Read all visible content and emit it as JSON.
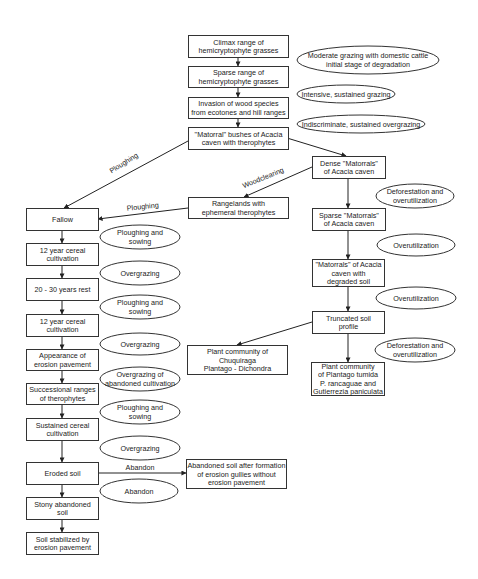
{
  "diagram": {
    "nodes": [
      {
        "id": "n1",
        "type": "box",
        "x": 188,
        "y": 35,
        "w": 100,
        "h": 22,
        "lines": [
          "Climax range of",
          "hemicryptophyte grasses"
        ]
      },
      {
        "id": "n2",
        "type": "box",
        "x": 188,
        "y": 66,
        "w": 100,
        "h": 21,
        "lines": [
          "Sparse range of",
          "hemicryptophyte grasses"
        ]
      },
      {
        "id": "n3",
        "type": "box",
        "x": 188,
        "y": 97,
        "w": 100,
        "h": 21,
        "lines": [
          "Invasion of wood species",
          "from ecotones and hill ranges"
        ]
      },
      {
        "id": "n4",
        "type": "box",
        "x": 188,
        "y": 127,
        "w": 100,
        "h": 22,
        "lines": [
          "\"Matorral\" bushes of Acacia",
          "caven with therophytes"
        ]
      },
      {
        "id": "n5",
        "type": "box",
        "x": 312,
        "y": 156,
        "w": 73,
        "h": 22,
        "lines": [
          "Dense \"Matorrals\"",
          "of Acacia caven"
        ]
      },
      {
        "id": "n6",
        "type": "box",
        "x": 188,
        "y": 197,
        "w": 100,
        "h": 21,
        "lines": [
          "Rangelands with",
          "ephemeral therophytes"
        ]
      },
      {
        "id": "n7",
        "type": "box",
        "x": 312,
        "y": 208,
        "w": 73,
        "h": 22,
        "lines": [
          "Sparse \"Matorrals\"",
          "of Acacia caven"
        ]
      },
      {
        "id": "n8",
        "type": "box",
        "x": 312,
        "y": 259,
        "w": 72,
        "h": 27,
        "lines": [
          "\"Matorrals\" of Acacia",
          "caven with",
          "degraded soil"
        ]
      },
      {
        "id": "n9",
        "type": "box",
        "x": 312,
        "y": 311,
        "w": 72,
        "h": 22,
        "lines": [
          "Truncated soil",
          "profile"
        ]
      },
      {
        "id": "n10",
        "type": "box",
        "x": 187,
        "y": 345,
        "w": 100,
        "h": 29,
        "lines": [
          "Plant community of",
          "Chuquiraga",
          "Plantago - Dichondra"
        ]
      },
      {
        "id": "n11",
        "type": "box",
        "x": 311,
        "y": 362,
        "w": 73,
        "h": 33,
        "lines": [
          "Plant community",
          "of Plantago tumida",
          "P. rancaguae and",
          "Gutierrezia paniculata"
        ]
      },
      {
        "id": "n12",
        "type": "box",
        "x": 26,
        "y": 208,
        "w": 72,
        "h": 22,
        "lines": [
          "Fallow"
        ]
      },
      {
        "id": "n13",
        "type": "box",
        "x": 26,
        "y": 243,
        "w": 72,
        "h": 22,
        "lines": [
          "12 year cereal",
          "cultivation"
        ]
      },
      {
        "id": "n14",
        "type": "box",
        "x": 26,
        "y": 278,
        "w": 72,
        "h": 22,
        "lines": [
          "20 - 30 years rest"
        ]
      },
      {
        "id": "n15",
        "type": "box",
        "x": 26,
        "y": 314,
        "w": 72,
        "h": 22,
        "lines": [
          "12 year cereal",
          "cultivation"
        ]
      },
      {
        "id": "n16",
        "type": "box",
        "x": 26,
        "y": 349,
        "w": 72,
        "h": 21,
        "lines": [
          "Appearance of",
          "erosion pavement"
        ]
      },
      {
        "id": "n17",
        "type": "box",
        "x": 26,
        "y": 383,
        "w": 72,
        "h": 21,
        "lines": [
          "Successional ranges",
          "of therophytes"
        ]
      },
      {
        "id": "n18",
        "type": "box",
        "x": 26,
        "y": 418,
        "w": 72,
        "h": 22,
        "lines": [
          "Sustained cereal",
          "cultivation"
        ]
      },
      {
        "id": "n19",
        "type": "box",
        "x": 26,
        "y": 462,
        "w": 72,
        "h": 22,
        "lines": [
          "Eroded soil"
        ]
      },
      {
        "id": "n20",
        "type": "box",
        "x": 186,
        "y": 459,
        "w": 100,
        "h": 29,
        "lines": [
          "Abandoned soil after formation",
          "of erosion gullies without",
          "erosion pavement"
        ]
      },
      {
        "id": "n21",
        "type": "box",
        "x": 26,
        "y": 497,
        "w": 72,
        "h": 22,
        "lines": [
          "Stony abandoned",
          "soil"
        ]
      },
      {
        "id": "n22",
        "type": "box",
        "x": 26,
        "y": 532,
        "w": 72,
        "h": 22,
        "lines": [
          "Soil stabilized by",
          "erosion pavement"
        ]
      }
    ],
    "ellipses": [
      {
        "id": "e1",
        "cx": 368,
        "cy": 60,
        "rx": 71,
        "ry": 14,
        "lines": [
          "Moderate grazing with domestic cattle",
          "initial stage of degradation"
        ]
      },
      {
        "id": "e2",
        "cx": 346,
        "cy": 94,
        "rx": 49,
        "ry": 9,
        "lines": [
          "Intensive, sustained grazing"
        ]
      },
      {
        "id": "e3",
        "cx": 361,
        "cy": 124,
        "rx": 64,
        "ry": 9,
        "lines": [
          "Indiscriminate, sustained overgrazing"
        ]
      },
      {
        "id": "e4",
        "cx": 415,
        "cy": 196,
        "rx": 39,
        "ry": 12,
        "lines": [
          "Deforestation and",
          "overutilization"
        ]
      },
      {
        "id": "e5",
        "cx": 416,
        "cy": 245,
        "rx": 39,
        "ry": 11,
        "lines": [
          "Overutilization"
        ]
      },
      {
        "id": "e6",
        "cx": 416,
        "cy": 298,
        "rx": 40,
        "ry": 11,
        "lines": [
          "Overutilization"
        ]
      },
      {
        "id": "e7",
        "cx": 415,
        "cy": 350,
        "rx": 40,
        "ry": 12,
        "lines": [
          "Deforestation and",
          "overutilization"
        ]
      },
      {
        "id": "e8",
        "cx": 140,
        "cy": 237,
        "rx": 40,
        "ry": 12,
        "lines": [
          "Ploughing and",
          "sowing"
        ]
      },
      {
        "id": "e9",
        "cx": 140,
        "cy": 273,
        "rx": 40,
        "ry": 12,
        "lines": [
          "Overgrazing"
        ]
      },
      {
        "id": "e10",
        "cx": 140,
        "cy": 307,
        "rx": 40,
        "ry": 12,
        "lines": [
          "Ploughing and",
          "sowing"
        ]
      },
      {
        "id": "e11",
        "cx": 140,
        "cy": 344,
        "rx": 40,
        "ry": 11,
        "lines": [
          "Overgrazing"
        ]
      },
      {
        "id": "e12",
        "cx": 140,
        "cy": 379,
        "rx": 40,
        "ry": 12,
        "lines": [
          "Overgrazing of",
          "abandoned cultivation"
        ]
      },
      {
        "id": "e13",
        "cx": 140,
        "cy": 412,
        "rx": 40,
        "ry": 12,
        "lines": [
          "Ploughing and",
          "sowing"
        ]
      },
      {
        "id": "e14",
        "cx": 140,
        "cy": 448,
        "rx": 40,
        "ry": 12,
        "lines": [
          "Overgrazing"
        ]
      },
      {
        "id": "e15",
        "cx": 139,
        "cy": 491,
        "rx": 39,
        "ry": 12,
        "lines": [
          "Abandon"
        ]
      }
    ],
    "edge_labels": [
      {
        "id": "l1",
        "text": "Ploughing",
        "x": 125,
        "y": 165,
        "rotate": -32
      },
      {
        "id": "l2",
        "text": "Woodclearing",
        "x": 264,
        "y": 180,
        "rotate": -22
      },
      {
        "id": "l3",
        "text": "Ploughing",
        "x": 143,
        "y": 209,
        "rotate": -6
      },
      {
        "id": "l4",
        "text": "Abandon",
        "x": 140,
        "y": 470,
        "rotate": 0
      }
    ]
  }
}
